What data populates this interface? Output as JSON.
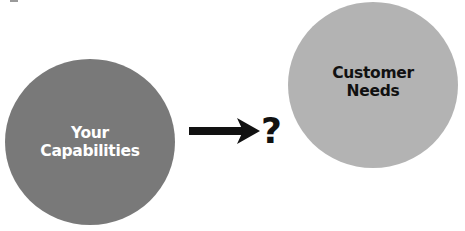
{
  "diagram": {
    "left_node": {
      "line1": "Your",
      "line2": "Capabilities",
      "fill": "#797979",
      "text_color": "#ffffff"
    },
    "right_node": {
      "line1": "Customer",
      "line2": "Needs",
      "fill": "#b3b3b3",
      "text_color": "#111111"
    },
    "connector": {
      "type": "arrow",
      "direction": "right",
      "color": "#111111"
    },
    "connector_label": "?"
  }
}
